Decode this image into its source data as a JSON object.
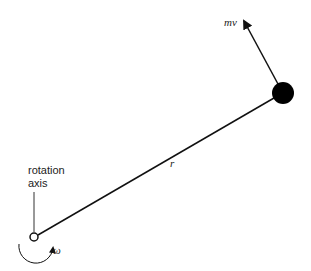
{
  "diagram": {
    "type": "angular-momentum-point-mass",
    "labels": {
      "axis_line1": "rotation",
      "axis_line2": "axis",
      "radius": "r",
      "momentum": "mv",
      "angular_velocity": "ω"
    },
    "colors": {
      "stroke": "#111111",
      "mass": "#000000",
      "text": "#222222",
      "background": "#ffffff"
    },
    "elements": {
      "pivot": {
        "cx": 34,
        "cy": 237,
        "r": 4
      },
      "mass": {
        "cx": 283,
        "cy": 93,
        "r": 11
      },
      "momentum_arrow_tip": {
        "x": 242,
        "y": 17
      }
    }
  }
}
